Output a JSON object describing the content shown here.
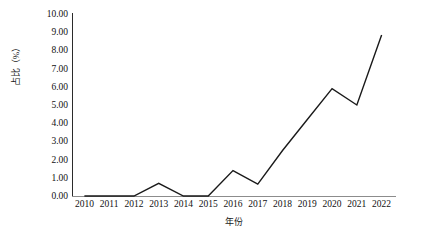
{
  "chart_data": {
    "type": "line",
    "title": "",
    "xlabel": "年份",
    "ylabel": "占比（%）",
    "categories": [
      "2010",
      "2011",
      "2012",
      "2013",
      "2014",
      "2015",
      "2016",
      "2017",
      "2018",
      "2019",
      "2020",
      "2021",
      "2022"
    ],
    "values": [
      0.0,
      0.0,
      0.0,
      0.7,
      0.0,
      0.0,
      1.4,
      0.65,
      2.5,
      4.2,
      5.9,
      5.0,
      8.85
    ],
    "ylim": [
      0,
      10
    ],
    "ytick_labels": [
      "10.00",
      "9.00",
      "8.00",
      "7.00",
      "6.00",
      "5.00",
      "4.00",
      "3.00",
      "2.00",
      "1.00",
      "0.00"
    ],
    "ytick_values": [
      10,
      9,
      8,
      7,
      6,
      5,
      4,
      3,
      2,
      1,
      0
    ],
    "grid": false,
    "legend": false,
    "series_color": "#1a1a1a"
  }
}
